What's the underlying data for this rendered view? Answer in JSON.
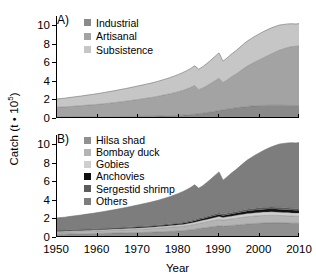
{
  "figure": {
    "ylabel_main": "Catch (t",
    "ylabel_mid": " • 10",
    "ylabel_exp": "5",
    "ylabel_close": ")",
    "xlabel": "Year",
    "panelA_letter": "A)",
    "panelB_letter": "B)"
  },
  "axes": {
    "ytick_labels": [
      "0",
      "2",
      "4",
      "6",
      "8",
      "10"
    ],
    "ytick_values": [
      0,
      2,
      4,
      6,
      8,
      10
    ],
    "xtick_labels": [
      "1950",
      "1960",
      "1970",
      "1980",
      "1990",
      "2000",
      "2010"
    ],
    "xtick_values": [
      1950,
      1960,
      1970,
      1980,
      1990,
      2000,
      2010
    ]
  },
  "colors": {
    "industrial": "#8a8a8a",
    "artisanal": "#a3a3a3",
    "subsistence": "#c6c6c6",
    "hilsa_shad": "#909090",
    "bombay_duck": "#b4b4b4",
    "gobies": "#cecece",
    "anchovies": "#101010",
    "sergestid_shrimp": "#5c5c5c",
    "others": "#7d7d7d",
    "axis": "#000000",
    "background": "#ffffff"
  },
  "legendA": [
    {
      "label": "Industrial",
      "color": "#8a8a8a"
    },
    {
      "label": "Artisanal",
      "color": "#a3a3a3"
    },
    {
      "label": "Subsistence",
      "color": "#c6c6c6"
    }
  ],
  "legendB": [
    {
      "label": "Hilsa shad",
      "color": "#909090"
    },
    {
      "label": "Bombay duck",
      "color": "#b4b4b4"
    },
    {
      "label": "Gobies",
      "color": "#cecece"
    },
    {
      "label": "Anchovies",
      "color": "#101010"
    },
    {
      "label": "Sergestid shrimp",
      "color": "#5c5c5c"
    },
    {
      "label": "Others",
      "color": "#7d7d7d"
    }
  ],
  "chart_data": [
    {
      "type": "area",
      "panel": "A",
      "title": "A)",
      "stacked": true,
      "xlabel": "Year",
      "ylabel": "Catch (t • 10^5)",
      "xlim": [
        1950,
        2010
      ],
      "ylim": [
        0,
        11
      ],
      "grid": false,
      "legend_position": "top-left",
      "x": [
        1950,
        1951,
        1952,
        1953,
        1954,
        1955,
        1956,
        1957,
        1958,
        1959,
        1960,
        1961,
        1962,
        1963,
        1964,
        1965,
        1966,
        1967,
        1968,
        1969,
        1970,
        1971,
        1972,
        1973,
        1974,
        1975,
        1976,
        1977,
        1978,
        1979,
        1980,
        1981,
        1982,
        1983,
        1984,
        1985,
        1986,
        1987,
        1988,
        1989,
        1990,
        1991,
        1992,
        1993,
        1994,
        1995,
        1996,
        1997,
        1998,
        1999,
        2000,
        2001,
        2002,
        2003,
        2004,
        2005,
        2006,
        2007,
        2008,
        2009,
        2010
      ],
      "series": [
        {
          "name": "Industrial",
          "values": [
            0.1,
            0.1,
            0.1,
            0.1,
            0.11,
            0.11,
            0.11,
            0.12,
            0.12,
            0.12,
            0.13,
            0.13,
            0.14,
            0.14,
            0.15,
            0.15,
            0.16,
            0.16,
            0.17,
            0.17,
            0.18,
            0.18,
            0.19,
            0.19,
            0.2,
            0.21,
            0.22,
            0.23,
            0.24,
            0.26,
            0.28,
            0.31,
            0.34,
            0.37,
            0.41,
            0.46,
            0.52,
            0.58,
            0.65,
            0.72,
            0.8,
            0.88,
            0.95,
            1.02,
            1.08,
            1.14,
            1.2,
            1.25,
            1.29,
            1.32,
            1.34,
            1.36,
            1.37,
            1.38,
            1.38,
            1.38,
            1.37,
            1.36,
            1.35,
            1.34,
            1.34
          ]
        },
        {
          "name": "Artisanal",
          "values": [
            1.05,
            1.08,
            1.1,
            1.13,
            1.16,
            1.19,
            1.22,
            1.25,
            1.28,
            1.31,
            1.34,
            1.38,
            1.42,
            1.46,
            1.5,
            1.55,
            1.6,
            1.65,
            1.7,
            1.76,
            1.82,
            1.88,
            1.94,
            2.0,
            2.07,
            2.14,
            2.22,
            2.3,
            2.38,
            2.47,
            2.56,
            2.66,
            2.78,
            2.92,
            3.1,
            2.6,
            2.72,
            2.9,
            3.1,
            3.3,
            3.5,
            2.95,
            3.15,
            3.4,
            3.6,
            3.85,
            4.1,
            4.35,
            4.55,
            4.75,
            4.95,
            5.15,
            5.35,
            5.55,
            5.75,
            5.95,
            6.1,
            6.25,
            6.35,
            6.4,
            6.45
          ]
        },
        {
          "name": "Subsistence",
          "values": [
            0.9,
            0.92,
            0.94,
            0.97,
            0.99,
            1.02,
            1.04,
            1.07,
            1.1,
            1.13,
            1.16,
            1.19,
            1.22,
            1.25,
            1.28,
            1.31,
            1.34,
            1.37,
            1.4,
            1.43,
            1.46,
            1.49,
            1.52,
            1.55,
            1.58,
            1.62,
            1.66,
            1.7,
            1.75,
            1.8,
            1.86,
            1.92,
            1.98,
            2.05,
            2.12,
            2.2,
            2.3,
            2.4,
            2.5,
            2.62,
            2.72,
            2.3,
            2.38,
            2.45,
            2.52,
            2.58,
            2.65,
            2.7,
            2.74,
            2.78,
            2.8,
            2.82,
            2.82,
            2.8,
            2.76,
            2.7,
            2.62,
            2.54,
            2.46,
            2.4,
            2.4
          ]
        }
      ],
      "totals": [
        2.05,
        2.1,
        2.14,
        2.2,
        2.26,
        2.32,
        2.37,
        2.44,
        2.5,
        2.56,
        2.63,
        2.7,
        2.78,
        2.85,
        2.93,
        3.01,
        3.1,
        3.18,
        3.27,
        3.36,
        3.46,
        3.55,
        3.65,
        3.74,
        3.85,
        3.97,
        4.1,
        4.23,
        4.37,
        4.53,
        4.7,
        4.89,
        5.1,
        5.34,
        5.63,
        5.26,
        5.54,
        5.88,
        6.25,
        6.64,
        7.02,
        6.13,
        6.48,
        6.87,
        7.2,
        7.57,
        7.95,
        8.3,
        8.58,
        8.85,
        9.09,
        9.33,
        9.54,
        9.73,
        9.89,
        10.03,
        10.09,
        10.15,
        10.16,
        10.14,
        10.19
      ]
    },
    {
      "type": "area",
      "panel": "B",
      "title": "B)",
      "stacked": true,
      "xlabel": "Year",
      "ylabel": "Catch (t • 10^5)",
      "xlim": [
        1950,
        2010
      ],
      "ylim": [
        0,
        11
      ],
      "grid": false,
      "legend_position": "top-left",
      "x": [
        1950,
        1951,
        1952,
        1953,
        1954,
        1955,
        1956,
        1957,
        1958,
        1959,
        1960,
        1961,
        1962,
        1963,
        1964,
        1965,
        1966,
        1967,
        1968,
        1969,
        1970,
        1971,
        1972,
        1973,
        1974,
        1975,
        1976,
        1977,
        1978,
        1979,
        1980,
        1981,
        1982,
        1983,
        1984,
        1985,
        1986,
        1987,
        1988,
        1989,
        1990,
        1991,
        1992,
        1993,
        1994,
        1995,
        1996,
        1997,
        1998,
        1999,
        2000,
        2001,
        2002,
        2003,
        2004,
        2005,
        2006,
        2007,
        2008,
        2009,
        2010
      ],
      "series": [
        {
          "name": "Hilsa shad",
          "values": [
            0.3,
            0.31,
            0.31,
            0.32,
            0.33,
            0.34,
            0.34,
            0.35,
            0.36,
            0.37,
            0.38,
            0.39,
            0.4,
            0.41,
            0.42,
            0.43,
            0.44,
            0.45,
            0.46,
            0.47,
            0.48,
            0.49,
            0.5,
            0.52,
            0.53,
            0.55,
            0.57,
            0.59,
            0.61,
            0.63,
            0.65,
            0.68,
            0.72,
            0.76,
            0.82,
            0.9,
            0.96,
            1.02,
            1.08,
            1.14,
            1.2,
            1.16,
            1.2,
            1.24,
            1.28,
            1.32,
            1.36,
            1.4,
            1.43,
            1.46,
            1.48,
            1.5,
            1.51,
            1.52,
            1.52,
            1.52,
            1.51,
            1.5,
            1.49,
            1.48,
            1.48
          ]
        },
        {
          "name": "Bombay duck",
          "values": [
            0.22,
            0.22,
            0.23,
            0.23,
            0.24,
            0.24,
            0.25,
            0.25,
            0.26,
            0.26,
            0.27,
            0.28,
            0.28,
            0.29,
            0.3,
            0.3,
            0.31,
            0.32,
            0.33,
            0.33,
            0.34,
            0.35,
            0.36,
            0.37,
            0.38,
            0.39,
            0.4,
            0.41,
            0.43,
            0.44,
            0.46,
            0.47,
            0.49,
            0.51,
            0.53,
            0.56,
            0.58,
            0.61,
            0.64,
            0.67,
            0.7,
            0.66,
            0.68,
            0.7,
            0.72,
            0.74,
            0.76,
            0.78,
            0.79,
            0.8,
            0.81,
            0.82,
            0.82,
            0.82,
            0.81,
            0.8,
            0.79,
            0.78,
            0.77,
            0.76,
            0.76
          ]
        },
        {
          "name": "Gobies",
          "values": [
            0.1,
            0.1,
            0.1,
            0.11,
            0.11,
            0.11,
            0.11,
            0.12,
            0.12,
            0.12,
            0.12,
            0.13,
            0.13,
            0.13,
            0.14,
            0.14,
            0.14,
            0.15,
            0.15,
            0.15,
            0.16,
            0.16,
            0.17,
            0.17,
            0.17,
            0.18,
            0.18,
            0.19,
            0.19,
            0.2,
            0.21,
            0.21,
            0.22,
            0.23,
            0.24,
            0.25,
            0.26,
            0.27,
            0.28,
            0.3,
            0.31,
            0.29,
            0.3,
            0.31,
            0.32,
            0.33,
            0.34,
            0.35,
            0.35,
            0.36,
            0.36,
            0.37,
            0.37,
            0.37,
            0.36,
            0.36,
            0.35,
            0.35,
            0.34,
            0.34,
            0.34
          ]
        },
        {
          "name": "Anchovies",
          "values": [
            0.06,
            0.06,
            0.06,
            0.06,
            0.06,
            0.07,
            0.07,
            0.07,
            0.07,
            0.07,
            0.07,
            0.08,
            0.08,
            0.08,
            0.08,
            0.08,
            0.09,
            0.09,
            0.09,
            0.09,
            0.09,
            0.1,
            0.1,
            0.1,
            0.1,
            0.11,
            0.11,
            0.11,
            0.12,
            0.12,
            0.13,
            0.13,
            0.14,
            0.15,
            0.16,
            0.17,
            0.18,
            0.19,
            0.2,
            0.21,
            0.22,
            0.21,
            0.22,
            0.23,
            0.24,
            0.25,
            0.26,
            0.27,
            0.28,
            0.29,
            0.3,
            0.31,
            0.31,
            0.32,
            0.32,
            0.32,
            0.32,
            0.31,
            0.31,
            0.3,
            0.3
          ]
        },
        {
          "name": "Sergestid shrimp",
          "values": [
            0.05,
            0.05,
            0.05,
            0.05,
            0.05,
            0.05,
            0.06,
            0.06,
            0.06,
            0.06,
            0.06,
            0.06,
            0.06,
            0.07,
            0.07,
            0.07,
            0.07,
            0.07,
            0.07,
            0.08,
            0.08,
            0.08,
            0.08,
            0.08,
            0.09,
            0.09,
            0.09,
            0.09,
            0.1,
            0.1,
            0.1,
            0.11,
            0.11,
            0.12,
            0.12,
            0.13,
            0.13,
            0.14,
            0.15,
            0.15,
            0.16,
            0.15,
            0.16,
            0.16,
            0.17,
            0.17,
            0.18,
            0.18,
            0.19,
            0.19,
            0.2,
            0.2,
            0.2,
            0.21,
            0.21,
            0.21,
            0.21,
            0.2,
            0.2,
            0.2,
            0.2
          ]
        },
        {
          "name": "Others",
          "values": [
            1.32,
            1.36,
            1.39,
            1.43,
            1.47,
            1.51,
            1.54,
            1.59,
            1.63,
            1.68,
            1.73,
            1.76,
            1.83,
            1.87,
            1.92,
            1.99,
            2.05,
            2.1,
            2.17,
            2.24,
            2.31,
            2.37,
            2.44,
            2.5,
            2.58,
            2.65,
            2.75,
            2.84,
            2.92,
            3.04,
            3.15,
            3.29,
            3.42,
            3.57,
            3.76,
            3.25,
            3.43,
            3.65,
            3.9,
            4.17,
            4.43,
            3.66,
            3.92,
            4.23,
            4.47,
            4.76,
            5.05,
            5.32,
            5.54,
            5.75,
            5.94,
            6.13,
            6.33,
            6.49,
            6.67,
            6.82,
            6.91,
            7.01,
            7.05,
            7.06,
            7.11
          ]
        }
      ],
      "totals": [
        2.05,
        2.1,
        2.14,
        2.2,
        2.26,
        2.32,
        2.37,
        2.44,
        2.5,
        2.56,
        2.63,
        2.7,
        2.78,
        2.85,
        2.93,
        3.01,
        3.1,
        3.18,
        3.27,
        3.36,
        3.46,
        3.55,
        3.65,
        3.74,
        3.85,
        3.97,
        4.1,
        4.23,
        4.37,
        4.53,
        4.7,
        4.89,
        5.1,
        5.34,
        5.63,
        5.26,
        5.54,
        5.88,
        6.25,
        6.64,
        7.02,
        6.13,
        6.48,
        6.87,
        7.2,
        7.57,
        7.95,
        8.3,
        8.58,
        8.85,
        9.09,
        9.33,
        9.54,
        9.73,
        9.89,
        10.03,
        10.09,
        10.15,
        10.16,
        10.14,
        10.19
      ]
    }
  ]
}
